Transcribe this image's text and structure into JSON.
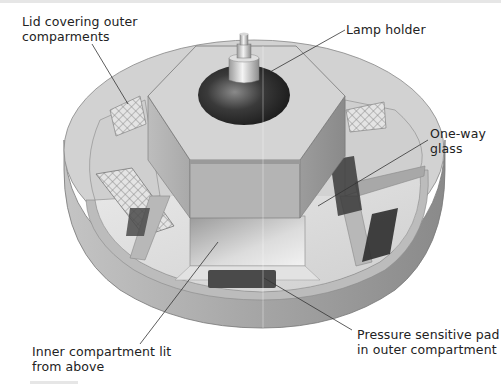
{
  "diagram": {
    "labels": {
      "lid": "Lid covering outer\ncomparments",
      "lamp": "Lamp holder",
      "glass": "One-way\nglass",
      "inner": "Inner compartment lit\nfrom above",
      "pad": "Pressure sensitive pad\nin outer compartment"
    },
    "colors": {
      "background": "#ffffff",
      "text": "#222222",
      "leader_line": "#333333",
      "body_grey": "#a9a9a9",
      "rim_dark": "#8e8e8e",
      "top_light": "#d8d8d8",
      "lamp_dark": "#2e2e2e",
      "pad_dark": "#4a4a4a"
    }
  }
}
